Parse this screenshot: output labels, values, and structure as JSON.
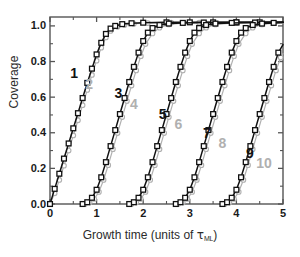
{
  "chart_data": {
    "type": "line",
    "title": "",
    "xlabel": "Growth time (units of τML)",
    "xlabel_base": "Growth time (units of ",
    "xlabel_symbol": "τ",
    "xlabel_subscript": "ML",
    "xlabel_tail": ")",
    "ylabel": "Coverage",
    "xlim": [
      0,
      5
    ],
    "ylim": [
      0,
      1.05
    ],
    "xticks": [
      0,
      1,
      2,
      3,
      4,
      5
    ],
    "xticklabels": [
      "0",
      "1",
      "2",
      "3",
      "4",
      "5"
    ],
    "yticks": [
      0.0,
      0.2,
      0.4,
      0.6,
      0.8,
      1.0
    ],
    "yticklabels": [
      "0.0",
      "0.2",
      "0.4",
      "0.6",
      "0.8",
      "1.0"
    ],
    "xminorticks": [
      0.5,
      1.5,
      2.5,
      3.5,
      4.5
    ],
    "yminorticks": [
      0.1,
      0.3,
      0.5,
      0.7,
      0.9
    ],
    "grid": false,
    "legend": "none",
    "colors": {
      "black_series": "#111111",
      "gray_series": "#b0b0b0",
      "frame": "#555555",
      "text": "#1a1a1a"
    },
    "marker_black": "open-square",
    "marker_gray": "open-circle",
    "annotations": [
      {
        "text": "1",
        "x": 0.52,
        "y": 0.735,
        "color": "black"
      },
      {
        "text": "2",
        "x": 0.84,
        "y": 0.676,
        "color": "gray"
      },
      {
        "text": "3",
        "x": 1.47,
        "y": 0.625,
        "color": "black"
      },
      {
        "text": "4",
        "x": 1.8,
        "y": 0.563,
        "color": "gray"
      },
      {
        "text": "5",
        "x": 2.42,
        "y": 0.508,
        "color": "black"
      },
      {
        "text": "6",
        "x": 2.76,
        "y": 0.45,
        "color": "gray"
      },
      {
        "text": "7",
        "x": 3.37,
        "y": 0.398,
        "color": "black"
      },
      {
        "text": "8",
        "x": 3.7,
        "y": 0.34,
        "color": "gray"
      },
      {
        "text": "9",
        "x": 4.29,
        "y": 0.285,
        "color": "black"
      },
      {
        "text": "10",
        "x": 4.62,
        "y": 0.228,
        "color": "gray"
      }
    ],
    "series": [
      {
        "name": "1",
        "color": "black",
        "marker": "open-square",
        "x": [
          0.0,
          0.1,
          0.2,
          0.3,
          0.4,
          0.5,
          0.6,
          0.7,
          0.8,
          0.9,
          1.0,
          1.1,
          1.2,
          1.3,
          1.4,
          1.55,
          1.75,
          2.0,
          2.5,
          3.0,
          3.5,
          4.0,
          4.5,
          5.0
        ],
        "y": [
          0.0,
          0.085,
          0.17,
          0.255,
          0.34,
          0.425,
          0.51,
          0.595,
          0.68,
          0.76,
          0.84,
          0.905,
          0.955,
          0.985,
          1.0,
          1.01,
          1.015,
          1.018,
          1.02,
          1.02,
          1.02,
          1.02,
          1.02,
          1.02
        ]
      },
      {
        "name": "2",
        "color": "gray",
        "marker": "open-circle",
        "x": [
          0.0,
          0.1,
          0.2,
          0.3,
          0.4,
          0.5,
          0.6,
          0.7,
          0.8,
          0.9,
          1.0,
          1.1,
          1.2,
          1.3,
          1.45,
          1.6,
          1.8,
          2.1,
          2.6,
          3.2,
          4.0,
          5.0
        ],
        "y": [
          0.0,
          0.06,
          0.135,
          0.215,
          0.3,
          0.385,
          0.47,
          0.555,
          0.64,
          0.725,
          0.805,
          0.878,
          0.935,
          0.972,
          0.995,
          1.005,
          1.012,
          1.016,
          1.018,
          1.018,
          1.018,
          1.018
        ]
      },
      {
        "name": "3",
        "color": "black",
        "marker": "open-square",
        "x": [
          0.7,
          0.8,
          0.9,
          1.0,
          1.1,
          1.2,
          1.3,
          1.4,
          1.5,
          1.6,
          1.7,
          1.8,
          1.9,
          2.0,
          2.1,
          2.2,
          2.35,
          2.55,
          2.85,
          3.3,
          4.0,
          5.0
        ],
        "y": [
          0.0,
          0.01,
          0.035,
          0.08,
          0.15,
          0.235,
          0.325,
          0.415,
          0.505,
          0.595,
          0.685,
          0.77,
          0.85,
          0.915,
          0.962,
          0.988,
          1.005,
          1.013,
          1.017,
          1.019,
          1.02,
          1.02
        ]
      },
      {
        "name": "4",
        "color": "gray",
        "marker": "open-circle",
        "x": [
          0.75,
          0.85,
          0.95,
          1.05,
          1.15,
          1.25,
          1.35,
          1.45,
          1.55,
          1.65,
          1.75,
          1.85,
          1.95,
          2.05,
          2.2,
          2.35,
          2.55,
          2.85,
          3.3,
          4.0,
          5.0
        ],
        "y": [
          0.0,
          0.008,
          0.028,
          0.068,
          0.135,
          0.218,
          0.308,
          0.398,
          0.488,
          0.578,
          0.665,
          0.75,
          0.83,
          0.898,
          0.958,
          0.99,
          1.008,
          1.015,
          1.018,
          1.018,
          1.018
        ]
      },
      {
        "name": "5",
        "color": "black",
        "marker": "open-square",
        "x": [
          1.7,
          1.8,
          1.9,
          2.0,
          2.1,
          2.2,
          2.3,
          2.4,
          2.5,
          2.6,
          2.7,
          2.8,
          2.9,
          3.0,
          3.1,
          3.2,
          3.35,
          3.55,
          3.9,
          4.4,
          5.0
        ],
        "y": [
          0.0,
          0.01,
          0.035,
          0.08,
          0.15,
          0.235,
          0.325,
          0.415,
          0.505,
          0.595,
          0.685,
          0.77,
          0.85,
          0.915,
          0.962,
          0.988,
          1.005,
          1.013,
          1.017,
          1.019,
          1.02
        ]
      },
      {
        "name": "6",
        "color": "gray",
        "marker": "open-circle",
        "x": [
          1.75,
          1.85,
          1.95,
          2.05,
          2.15,
          2.25,
          2.35,
          2.45,
          2.55,
          2.65,
          2.75,
          2.85,
          2.95,
          3.05,
          3.2,
          3.35,
          3.55,
          3.9,
          4.4,
          5.0
        ],
        "y": [
          0.0,
          0.008,
          0.028,
          0.068,
          0.135,
          0.218,
          0.308,
          0.398,
          0.488,
          0.578,
          0.665,
          0.75,
          0.83,
          0.898,
          0.958,
          0.99,
          1.008,
          1.015,
          1.018,
          1.018
        ]
      },
      {
        "name": "7",
        "color": "black",
        "marker": "open-square",
        "x": [
          2.7,
          2.8,
          2.9,
          3.0,
          3.1,
          3.2,
          3.3,
          3.4,
          3.5,
          3.6,
          3.7,
          3.8,
          3.9,
          4.0,
          4.1,
          4.2,
          4.35,
          4.55,
          4.8,
          5.0
        ],
        "y": [
          0.0,
          0.01,
          0.035,
          0.08,
          0.15,
          0.235,
          0.325,
          0.415,
          0.505,
          0.595,
          0.685,
          0.77,
          0.85,
          0.915,
          0.962,
          0.988,
          1.005,
          1.013,
          1.017,
          1.019
        ]
      },
      {
        "name": "8",
        "color": "gray",
        "marker": "open-circle",
        "x": [
          2.75,
          2.85,
          2.95,
          3.05,
          3.15,
          3.25,
          3.35,
          3.45,
          3.55,
          3.65,
          3.75,
          3.85,
          3.95,
          4.05,
          4.2,
          4.35,
          4.55,
          4.8,
          5.0
        ],
        "y": [
          0.0,
          0.008,
          0.028,
          0.068,
          0.135,
          0.218,
          0.308,
          0.398,
          0.488,
          0.578,
          0.665,
          0.75,
          0.83,
          0.898,
          0.958,
          0.99,
          1.008,
          1.015,
          1.018
        ]
      },
      {
        "name": "9",
        "color": "black",
        "marker": "open-square",
        "x": [
          3.7,
          3.8,
          3.9,
          4.0,
          4.1,
          4.2,
          4.3,
          4.4,
          4.5,
          4.6,
          4.7,
          4.8,
          4.9,
          5.0
        ],
        "y": [
          0.0,
          0.01,
          0.035,
          0.08,
          0.15,
          0.235,
          0.325,
          0.415,
          0.505,
          0.595,
          0.685,
          0.77,
          0.85,
          0.895
        ]
      },
      {
        "name": "10",
        "color": "gray",
        "marker": "open-circle",
        "x": [
          3.75,
          3.85,
          3.95,
          4.05,
          4.15,
          4.25,
          4.35,
          4.45,
          4.55,
          4.65,
          4.75,
          4.85,
          4.95,
          5.0
        ],
        "y": [
          0.0,
          0.008,
          0.028,
          0.068,
          0.135,
          0.218,
          0.308,
          0.398,
          0.488,
          0.578,
          0.665,
          0.75,
          0.822,
          0.845
        ]
      }
    ]
  }
}
